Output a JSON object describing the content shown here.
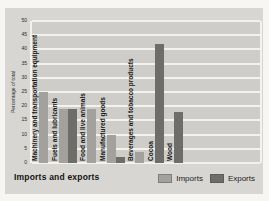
{
  "figure": {
    "title": "Imports and exports",
    "background_color": "#d8d6d2",
    "plot_background_color": "#cfcdc9",
    "gridline_color": "#f3f2ef"
  },
  "chart_data": {
    "type": "bar",
    "title": "Imports and exports",
    "xlabel": "",
    "ylabel": "Percentage of total",
    "ylim": [
      0,
      50
    ],
    "yticks": [
      0,
      5,
      10,
      15,
      20,
      25,
      30,
      35,
      40,
      45,
      50
    ],
    "grid": "horizontal-white",
    "legend_position": "bottom-right",
    "categories": [
      "Machinery and transportation equipment",
      "Fuels and lubricants",
      "Food and live animals",
      "Manufactured goods",
      "Beverages and tobacco products",
      "Cocoa",
      "Wood"
    ],
    "series": [
      {
        "name": "Imports",
        "color": "#a3a19e",
        "values": [
          25,
          19,
          19,
          10,
          4,
          null,
          null
        ]
      },
      {
        "name": "Exports",
        "color": "#6f6d6a",
        "values": [
          null,
          19,
          null,
          2,
          null,
          42,
          18
        ]
      }
    ]
  }
}
